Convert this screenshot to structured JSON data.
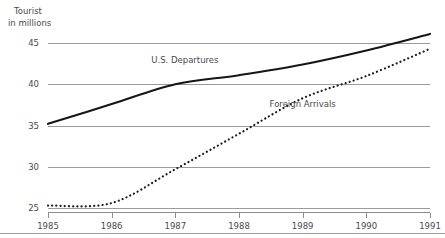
{
  "chart_data": {
    "type": "line",
    "title": "Tourist in millions",
    "title_line1": "Tourist",
    "title_line2": "in millions",
    "xlabel": "",
    "ylabel": "",
    "x": [
      1985,
      1986,
      1987,
      1988,
      1989,
      1990,
      1991
    ],
    "categories": [
      "1985",
      "1986",
      "1987",
      "1988",
      "1989",
      "1990",
      "1991"
    ],
    "xlim": [
      1985,
      1991
    ],
    "ylim": [
      25,
      47
    ],
    "yticks": [
      25,
      30,
      35,
      40,
      45
    ],
    "ytick_labels": [
      "25",
      "30",
      "35",
      "40",
      "45"
    ],
    "grid": true,
    "legend_position": "inline-annotation",
    "series": [
      {
        "name": "U.S. Departures",
        "style": "solid",
        "color": "#161616",
        "label_x": 1987.15,
        "label_y": 42.6,
        "values": [
          35.2,
          37.6,
          40.0,
          41.1,
          42.4,
          44.1,
          46.1
        ]
      },
      {
        "name": "Foreign Arrivals",
        "style": "dotted",
        "color": "#1d1d1d",
        "label_x": 1989.0,
        "label_y": 37.3,
        "values": [
          25.3,
          25.6,
          29.7,
          34.0,
          38.3,
          41.0,
          44.3
        ]
      }
    ],
    "annotations": [
      {
        "text": "U.S. Departures",
        "x": 1987.15,
        "y": 42.6
      },
      {
        "text": "Foreign Arrivals",
        "x": 1989.0,
        "y": 37.3
      }
    ]
  }
}
